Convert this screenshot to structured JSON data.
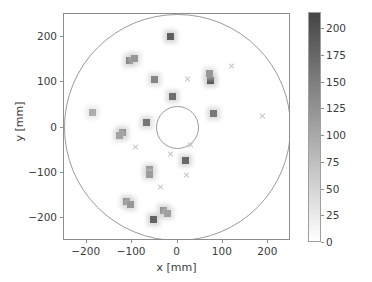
{
  "chart_data": {
    "type": "scatter",
    "title": "",
    "xlabel": "x [mm]",
    "ylabel": "y [mm]",
    "xlim": [
      -250,
      250
    ],
    "ylim": [
      -250,
      250
    ],
    "xticks": [
      -200,
      -100,
      0,
      100,
      200
    ],
    "yticks": [
      -200,
      -100,
      0,
      100,
      200
    ],
    "xticklabels": [
      "−200",
      "−100",
      "0",
      "100",
      "200"
    ],
    "yticklabels": [
      "−200",
      "−100",
      "0",
      "100",
      "200"
    ],
    "grid": false,
    "colorbar": {
      "label": "SiPM signal (phe)",
      "vmin": 0,
      "vmax": 215,
      "ticks": [
        0,
        25,
        50,
        75,
        100,
        125,
        150,
        175,
        200
      ],
      "ticklabels": [
        "0",
        "25",
        "50",
        "75",
        "100",
        "125",
        "150",
        "175",
        "200"
      ],
      "cmap": "grayscale-reversed",
      "color_low": "#ffffff",
      "color_high": "#454545"
    },
    "guides": [
      {
        "name": "outer-detector-boundary",
        "shape": "circle",
        "cx": 0,
        "cy": 0,
        "r": 250
      },
      {
        "name": "inner-bore-boundary",
        "shape": "circle",
        "cx": 0,
        "cy": 0,
        "r": 48
      }
    ],
    "series": [
      {
        "name": "SiPM hits",
        "marker": "square",
        "points": [
          {
            "x": -15,
            "y": 200,
            "value": 185
          },
          {
            "x": -105,
            "y": 148,
            "value": 150
          },
          {
            "x": -94,
            "y": 152,
            "value": 120
          },
          {
            "x": -50,
            "y": 106,
            "value": 140
          },
          {
            "x": 72,
            "y": 104,
            "value": 195
          },
          {
            "x": 70,
            "y": 118,
            "value": 120
          },
          {
            "x": -12,
            "y": 68,
            "value": 165
          },
          {
            "x": 80,
            "y": 30,
            "value": 155
          },
          {
            "x": -188,
            "y": 34,
            "value": 95
          },
          {
            "x": -68,
            "y": 10,
            "value": 160
          },
          {
            "x": -122,
            "y": -10,
            "value": 150
          },
          {
            "x": -128,
            "y": -18,
            "value": 105
          },
          {
            "x": 18,
            "y": -72,
            "value": 175
          },
          {
            "x": -62,
            "y": -92,
            "value": 130
          },
          {
            "x": -62,
            "y": -104,
            "value": 115
          },
          {
            "x": -112,
            "y": -162,
            "value": 140
          },
          {
            "x": -104,
            "y": -170,
            "value": 120
          },
          {
            "x": -30,
            "y": -182,
            "value": 145
          },
          {
            "x": -22,
            "y": -190,
            "value": 110
          },
          {
            "x": -52,
            "y": -202,
            "value": 180
          }
        ]
      },
      {
        "name": "Empty SiPM channels",
        "marker": "x",
        "points": [
          {
            "x": 22,
            "y": 106
          },
          {
            "x": 120,
            "y": 136
          },
          {
            "x": 188,
            "y": 26
          },
          {
            "x": 28,
            "y": -38
          },
          {
            "x": -92,
            "y": -44
          },
          {
            "x": -16,
            "y": -58
          },
          {
            "x": 20,
            "y": -104
          },
          {
            "x": -38,
            "y": -132
          }
        ]
      }
    ]
  }
}
